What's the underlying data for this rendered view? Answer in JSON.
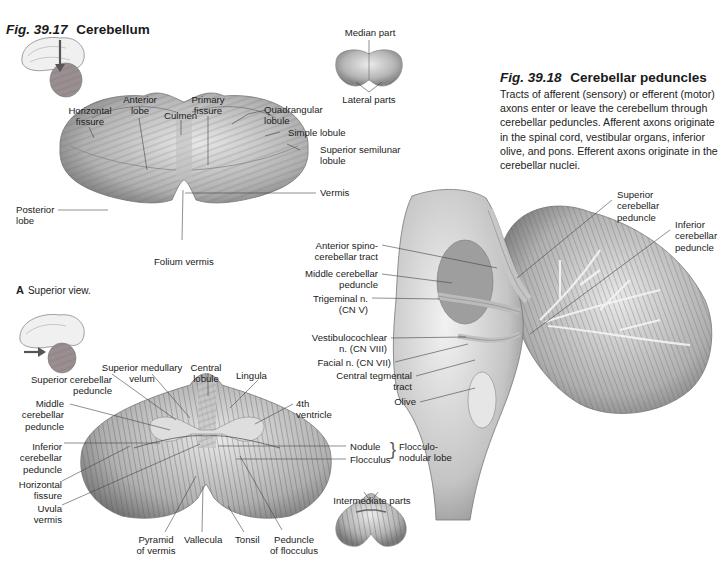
{
  "fig_39_17": {
    "number": "Fig. 39.17",
    "title": "Cerebellum",
    "thumbnail_top": {
      "icon": "brain-sagittal-arrow-down-icon"
    },
    "thumbnail_bottom": {
      "icon": "brain-sagittal-arrow-right-icon"
    },
    "inset_top": {
      "labels": {
        "median": "Median part",
        "lateral": "Lateral parts"
      }
    },
    "inset_bottom": {
      "labels": {
        "intermediate": "Intermediate parts"
      }
    },
    "view_a": {
      "letter": "A",
      "caption": "Superior view.",
      "labels": {
        "horizontal_fissure": "Horizontal\nfissure",
        "anterior_lobe": "Anterior\nlobe",
        "primary_fissure": "Primary\nfissure",
        "culmen": "Culmen",
        "quadrangular_lobule": "Quadrangular\nlobule",
        "simple_lobule": "Simple lobule",
        "superior_semilunar_lobule": "Superior semilunar\nlobule",
        "vermis": "Vermis",
        "posterior_lobe": "Posterior\nlobe",
        "folium_vermis": "Folium vermis"
      }
    },
    "view_b": {
      "labels": {
        "superior_medullary_velum": "Superior medullary\nvelum",
        "central_lobule": "Central\nlobule",
        "lingula": "Lingula",
        "superior_cerebellar_peduncle": "Superior cerebellar\npeduncle",
        "middle_cerebellar_peduncle": "Middle\ncerebellar\npeduncle",
        "fourth_ventricle": "4th\nventricle",
        "inferior_cerebellar_peduncle": "Inferior\ncerebellar\npeduncle",
        "horizontal_fissure": "Horizontal\nfissure",
        "uvula_vermis": "Uvula\nvermis",
        "nodule": "Nodule",
        "flocculus": "Flocculus",
        "flocculonodular_lobe": "Flocculo-\nnodular lobe",
        "pyramid_of_vermis": "Pyramid\nof vermis",
        "vallecula": "Vallecula",
        "tonsil": "Tonsil",
        "peduncle_of_flocculus": "Peduncle\nof flocculus"
      }
    }
  },
  "fig_39_18": {
    "number": "Fig. 39.18",
    "title": "Cerebellar peduncles",
    "caption": "Tracts of afferent (sensory) or efferent (motor) axons enter or leave the cerebellum through cerebellar peduncles. Afferent axons originate in the spinal cord, vestibular organs, inferior olive, and pons. Efferent axons originate in the cerebellar nuclei.",
    "labels": {
      "superior_cerebellar_peduncle": "Superior\ncerebellar\npeduncle",
      "inferior_cerebellar_peduncle": "Inferior\ncerebellar\npeduncle",
      "anterior_spinocerebellar_tract": "Anterior spino-\ncerebellar tract",
      "middle_cerebellar_peduncle": "Middle cerebellar\npeduncle",
      "trigeminal_nerve": "Trigeminal n.\n(CN V)",
      "vestibulocochlear_nerve": "Vestibulocochlear\nn. (CN VIII)",
      "facial_nerve": "Facial n. (CN VII)",
      "central_tegmental_tract": "Central tegmental\ntract",
      "olive": "Olive"
    }
  },
  "colors": {
    "ink": "#1a1a1a",
    "tissue_light": "#d9d9d9",
    "tissue_mid": "#a8a8a8",
    "tissue_dark": "#6e6e6e",
    "leader": "#444444"
  }
}
